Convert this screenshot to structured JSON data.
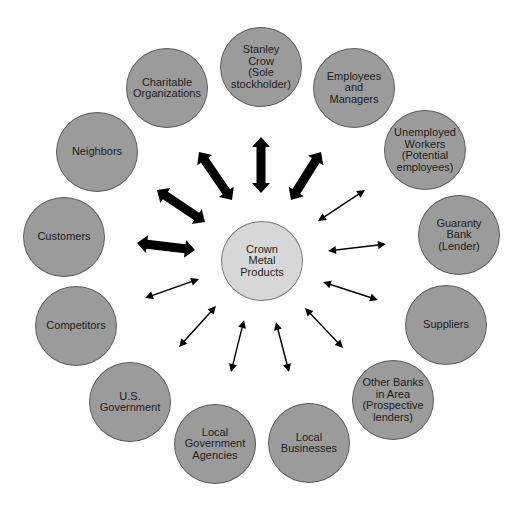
{
  "diagram": {
    "center": {
      "label": "Crown\nMetal\nProducts",
      "x": 262,
      "y": 261,
      "fill": "#d7d7d7"
    },
    "stakeholder_fill": "#9b9b9b",
    "arrow_color": "#000000",
    "stakeholders": [
      {
        "id": "stanley-crow",
        "label": "Stanley\nCrow\n(Sole\nstockholder)",
        "x": 261,
        "y": 67,
        "arrow": "bold",
        "from": [
          261,
          137
        ],
        "to": [
          261,
          193
        ]
      },
      {
        "id": "employees-managers",
        "label": "Employees\nand\nManagers",
        "x": 354,
        "y": 88,
        "arrow": "bold",
        "from": [
          321,
          152
        ],
        "to": [
          291,
          200
        ]
      },
      {
        "id": "unemployed-workers",
        "label": "Unemployed\nWorkers\n(Potential\nemployees)",
        "x": 425,
        "y": 150,
        "arrow": "thin",
        "from": [
          365,
          190
        ],
        "to": [
          318,
          221
        ]
      },
      {
        "id": "guaranty-bank",
        "label": "Guaranty\nBank\n(Lender)",
        "x": 459,
        "y": 235,
        "arrow": "thin",
        "from": [
          386,
          244
        ],
        "to": [
          328,
          251
        ]
      },
      {
        "id": "suppliers",
        "label": "Suppliers",
        "x": 446,
        "y": 325,
        "arrow": "thin",
        "from": [
          378,
          300
        ],
        "to": [
          323,
          282
        ]
      },
      {
        "id": "other-banks",
        "label": "Other Banks\nin Area\n(Prospective\nlenders)",
        "x": 393,
        "y": 400,
        "arrow": "thin",
        "from": [
          343,
          348
        ],
        "to": [
          305,
          308
        ]
      },
      {
        "id": "local-businesses",
        "label": "Local\nBusinesses",
        "x": 309,
        "y": 443,
        "arrow": "thin",
        "from": [
          289,
          372
        ],
        "to": [
          276,
          322
        ]
      },
      {
        "id": "local-government-agencies",
        "label": "Local\nGovernment\nAgencies",
        "x": 215,
        "y": 444,
        "arrow": "thin",
        "from": [
          231,
          372
        ],
        "to": [
          244,
          320
        ]
      },
      {
        "id": "us-government",
        "label": "U.S.\nGovernment",
        "x": 130,
        "y": 402,
        "arrow": "thin",
        "from": [
          179,
          347
        ],
        "to": [
          216,
          306
        ]
      },
      {
        "id": "competitors",
        "label": "Competitors",
        "x": 76,
        "y": 326,
        "arrow": "thin",
        "from": [
          145,
          298
        ],
        "to": [
          199,
          279
        ]
      },
      {
        "id": "customers",
        "label": "Customers",
        "x": 64,
        "y": 237,
        "arrow": "bold",
        "from": [
          137,
          243
        ],
        "to": [
          195,
          250
        ]
      },
      {
        "id": "neighbors",
        "label": "Neighbors",
        "x": 97,
        "y": 152,
        "arrow": "bold",
        "from": [
          157,
          190
        ],
        "to": [
          205,
          222
        ]
      },
      {
        "id": "charitable-organizations",
        "label": "Charitable\nOrganizations",
        "x": 167,
        "y": 88,
        "arrow": "bold",
        "from": [
          199,
          152
        ],
        "to": [
          232,
          200
        ]
      }
    ]
  }
}
